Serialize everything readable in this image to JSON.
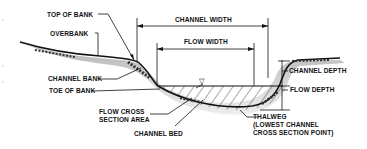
{
  "diagram": {
    "type": "stream channel cross-section",
    "labels": {
      "top_of_bank": "TOP OF BANK",
      "overbank": "OVERBANK",
      "channel_bank": "CHANNEL BANK",
      "toe_of_bank": "TOE OF BANK",
      "flow_cross_section_area_line1": "FLOW CROSS",
      "flow_cross_section_area_line2": "SECTION AREA",
      "channel_bed": "CHANNEL BED",
      "channel_width": "CHANNEL WIDTH",
      "flow_width": "FLOW WIDTH",
      "channel_depth": "CHANNEL DEPTH",
      "flow_depth": "FLOW DEPTH",
      "thalweg_line1": "THALWEG",
      "thalweg_line2": "(LOWEST CHANNEL",
      "thalweg_line3": "CROSS SECTION POINT)"
    },
    "symbols": {
      "water_surface": "▽"
    },
    "colors": {
      "ink": "#111111",
      "ground_shadow": "#c8c8c8",
      "hatch": "#555555",
      "background": "#ffffff"
    }
  }
}
